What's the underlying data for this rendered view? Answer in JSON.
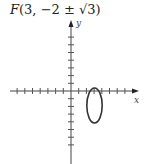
{
  "title": {
    "point_name": "F",
    "coords": "(3, −2 ± √3)"
  },
  "graph": {
    "x_axis_label": "x",
    "y_axis_label": "y",
    "origin_px": [
      71,
      91
    ],
    "tick_spacing_px": 7.7,
    "x_ticks_left": 8,
    "x_ticks_right": 8,
    "y_ticks_up": 7,
    "y_ticks_down": 7,
    "ellipse": {
      "center": [
        3,
        -2
      ],
      "semi_axis_x": 1,
      "semi_axis_y": 2.3,
      "color": "#333333"
    }
  }
}
